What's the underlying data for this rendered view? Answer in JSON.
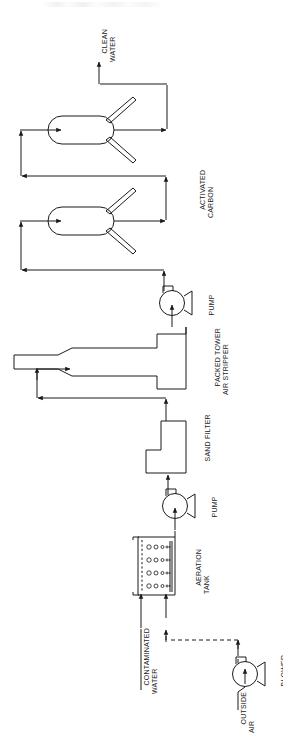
{
  "diagram": {
    "orientation": "rotated-90-ccw",
    "stroke_color": "#1a1a1a",
    "background_color": "#ffffff",
    "labels": {
      "clean_water": "CLEAN\nWATER",
      "activated_carbon": "ACTIVATED\nCARBON",
      "pump_upper": "PUMP",
      "packed_tower": "PACKED TOWER\nAIR STRIPPER",
      "sand_filter": "SAND FILTER",
      "pump_lower": "PUMP",
      "aeration_tank": "AERATION\nTANK",
      "contaminated_water": "CONTAMINATED\nWATER",
      "outside_air": "OUTSIDE\nAIR",
      "blower": "BLOWER"
    },
    "equipment": [
      {
        "name": "aeration-tank",
        "label": "AERATION TANK",
        "type": "tank"
      },
      {
        "name": "blower",
        "label": "BLOWER",
        "type": "blower"
      },
      {
        "name": "pump-lower",
        "label": "PUMP",
        "type": "centrifugal-pump"
      },
      {
        "name": "sand-filter",
        "label": "SAND FILTER",
        "type": "filter"
      },
      {
        "name": "packed-tower-air-stripper",
        "label": "PACKED TOWER AIR STRIPPER",
        "type": "column"
      },
      {
        "name": "pump-upper",
        "label": "PUMP",
        "type": "centrifugal-pump"
      },
      {
        "name": "activated-carbon-vessel-1",
        "label": "ACTIVATED CARBON",
        "type": "carbon-vessel"
      },
      {
        "name": "activated-carbon-vessel-2",
        "label": "ACTIVATED CARBON",
        "type": "carbon-vessel"
      }
    ],
    "streams": [
      {
        "name": "contaminated-water-feed",
        "label": "CONTAMINATED WATER",
        "style": "solid"
      },
      {
        "name": "outside-air-feed",
        "label": "OUTSIDE AIR",
        "style": "solid"
      },
      {
        "name": "blower-air-to-aeration-tank",
        "label": "",
        "style": "dashed"
      },
      {
        "name": "aeration-to-pump",
        "label": "",
        "style": "solid"
      },
      {
        "name": "pump-to-sand-filter",
        "label": "",
        "style": "solid"
      },
      {
        "name": "sand-filter-to-tower",
        "label": "",
        "style": "solid"
      },
      {
        "name": "tower-to-pump",
        "label": "",
        "style": "solid"
      },
      {
        "name": "pump-to-carbon-1",
        "label": "",
        "style": "solid"
      },
      {
        "name": "carbon-1-to-carbon-2",
        "label": "",
        "style": "solid"
      },
      {
        "name": "carbon-2-to-clean-water",
        "label": "CLEAN WATER",
        "style": "solid"
      }
    ]
  }
}
